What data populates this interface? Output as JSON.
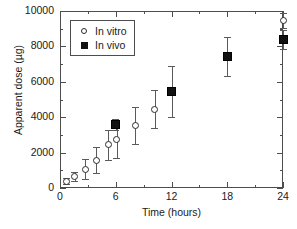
{
  "chart_data": {
    "type": "scatter",
    "title": "",
    "xlabel": "Time (hours)",
    "ylabel": "Apparent dose (µg)",
    "xlim": [
      0,
      24
    ],
    "ylim": [
      0,
      10000
    ],
    "xticks": [
      0,
      6,
      12,
      18,
      24
    ],
    "xtick_labels": [
      "0",
      "6",
      "12",
      "18",
      "24"
    ],
    "yticks": [
      0,
      2000,
      4000,
      6000,
      8000,
      10000
    ],
    "ytick_labels": [
      "0",
      "2000",
      "4000",
      "6000",
      "8000",
      "10000"
    ],
    "x_minor_ticks": [
      3,
      9,
      15,
      21
    ],
    "y_minor_ticks": [
      1000,
      3000,
      5000,
      7000,
      9000
    ],
    "grid": false,
    "legend_position": "upper left",
    "series": [
      {
        "name": "In vitro",
        "marker": "open-circle",
        "color": "#2b2b2b",
        "points": [
          {
            "x": 0.7,
            "y": 380,
            "yerr": 170
          },
          {
            "x": 1.6,
            "y": 650,
            "yerr": 280
          },
          {
            "x": 2.7,
            "y": 1060,
            "yerr": 560
          },
          {
            "x": 3.9,
            "y": 1580,
            "yerr": 760
          },
          {
            "x": 5.2,
            "y": 2440,
            "yerr": 860
          },
          {
            "x": 6.1,
            "y": 2750,
            "yerr": 1050
          },
          {
            "x": 8.1,
            "y": 3550,
            "yerr": 1040
          },
          {
            "x": 10.2,
            "y": 4450,
            "yerr": 1070
          },
          {
            "x": 24.0,
            "y": 9450,
            "yerr": 420
          }
        ]
      },
      {
        "name": "In vivo",
        "marker": "filled-square",
        "color": "#111111",
        "points": [
          {
            "x": 6.0,
            "y": 3600,
            "yerr": 300
          },
          {
            "x": 12.0,
            "y": 5450,
            "yerr": 1450
          },
          {
            "x": 18.0,
            "y": 7450,
            "yerr": 1100
          },
          {
            "x": 24.0,
            "y": 8400,
            "yerr": 520
          }
        ]
      }
    ],
    "legend": [
      {
        "label": "In vitro",
        "marker": "open-circle"
      },
      {
        "label": "In vivo",
        "marker": "filled-square"
      }
    ]
  }
}
